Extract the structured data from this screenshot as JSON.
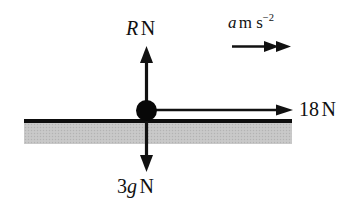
{
  "figure": {
    "type": "force-diagram",
    "background_color": "#ffffff",
    "stroke_color": "#111111",
    "ground_color": "#c6c6c6"
  },
  "labels": {
    "normal_reaction": {
      "symbol": "R",
      "unit": "N",
      "text": "R N"
    },
    "weight": {
      "coefficient": "3",
      "symbol": "g",
      "unit": "N",
      "text": "3g N"
    },
    "applied_force": {
      "value": "18",
      "unit": "N",
      "text": "18 N"
    },
    "acceleration": {
      "symbol": "a",
      "unit_base": "m s",
      "unit_exponent": "−2",
      "text": "a m s^-2"
    }
  },
  "vectors": [
    {
      "name": "normal-reaction-arrow",
      "direction": "up",
      "heads": 1
    },
    {
      "name": "weight-arrow",
      "direction": "down",
      "heads": 1
    },
    {
      "name": "applied-force-arrow",
      "direction": "right",
      "heads": 1
    },
    {
      "name": "acceleration-arrow",
      "direction": "right",
      "heads": 2
    }
  ],
  "objects": [
    {
      "name": "particle",
      "shape": "filled-circle"
    },
    {
      "name": "ground-surface",
      "shape": "hatched-band"
    }
  ]
}
